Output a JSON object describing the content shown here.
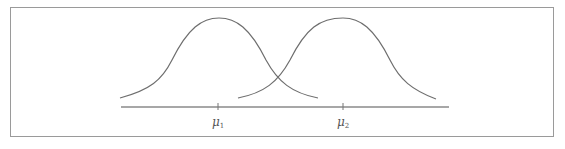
{
  "diagram": {
    "labels": [
      {
        "symbol": "μ",
        "subscript": "1",
        "x": 218
      },
      {
        "symbol": "μ",
        "subscript": "2",
        "x": 343
      }
    ],
    "colors": {
      "curve": "#6e6e6e",
      "axis": "#8a8a8a",
      "frame": "#9a9a9a"
    }
  }
}
